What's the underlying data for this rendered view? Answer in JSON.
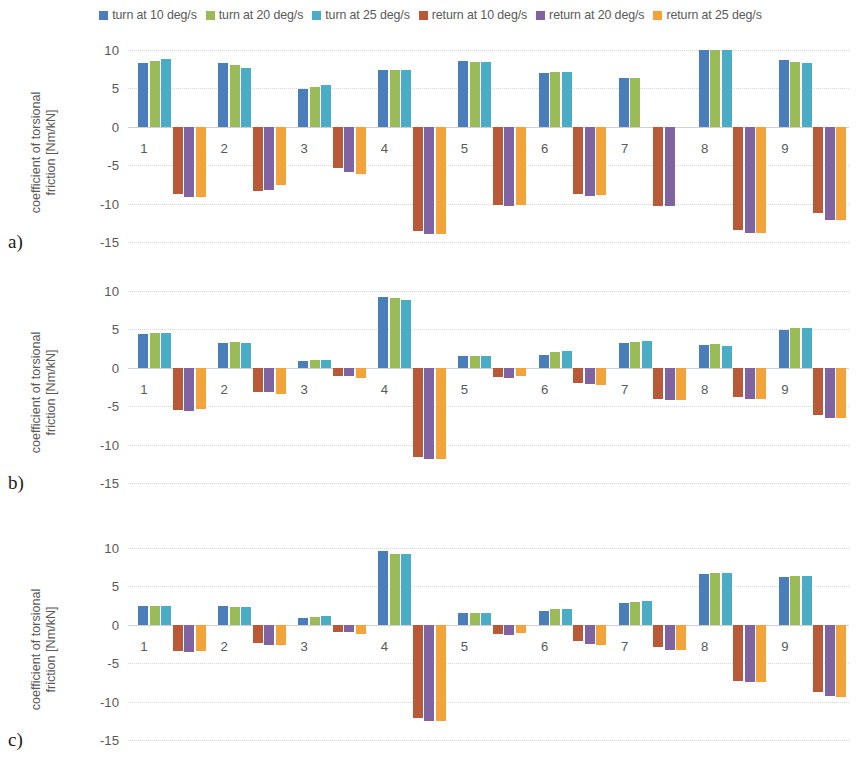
{
  "legend": {
    "entries": [
      {
        "label": "turn at 10 deg/s",
        "color": "#4A7EBB",
        "key": "turn10"
      },
      {
        "label": "turn at 20 deg/s",
        "color": "#9BBB59",
        "key": "turn20"
      },
      {
        "label": "turn at 25 deg/s",
        "color": "#4BACC6",
        "key": "turn25"
      },
      {
        "label": "return at 10 deg/s",
        "color": "#B85A37",
        "key": "ret10"
      },
      {
        "label": "return at 20 deg/s",
        "color": "#8064A2",
        "key": "ret20"
      },
      {
        "label": "return at 25 deg/s",
        "color": "#F2A33C",
        "key": "ret25"
      }
    ]
  },
  "panels": [
    {
      "id": "a",
      "letter": "a)"
    },
    {
      "id": "b",
      "letter": "b)"
    },
    {
      "id": "c",
      "letter": "c)"
    }
  ],
  "axis": {
    "ylabel_line1": "coefficient of torsional",
    "ylabel_line2": "friction [Nm/kN]",
    "yticks": [
      10,
      5,
      0,
      -5,
      -10,
      -15
    ],
    "ytick_labels": [
      "10",
      "5",
      "0",
      "-5",
      "-10",
      "-15"
    ],
    "ylim": [
      -15,
      10
    ],
    "categories": [
      "1",
      "2",
      "3",
      "4",
      "5",
      "6",
      "7",
      "8",
      "9"
    ]
  },
  "chart_data": [
    {
      "type": "bar",
      "panel": "a",
      "title": "",
      "xlabel": "",
      "ylabel": "coefficient of torsional friction [Nm/kN]",
      "ylim": [
        -15,
        10
      ],
      "yticks": [
        10,
        5,
        0,
        -5,
        -10,
        -15
      ],
      "grid": true,
      "legend_position": "top",
      "categories": [
        "1",
        "2",
        "3",
        "4",
        "5",
        "6",
        "7",
        "8",
        "9"
      ],
      "series": [
        {
          "name": "turn at 10 deg/s",
          "color": "#4A7EBB",
          "values": [
            8.3,
            8.3,
            4.9,
            7.4,
            8.6,
            7.0,
            6.4,
            10.0,
            8.7
          ]
        },
        {
          "name": "turn at 20 deg/s",
          "color": "#9BBB59",
          "values": [
            8.6,
            8.0,
            5.2,
            7.4,
            8.5,
            7.2,
            6.3,
            10.0,
            8.5
          ]
        },
        {
          "name": "turn at 25 deg/s",
          "color": "#4BACC6",
          "values": [
            8.8,
            7.7,
            5.5,
            7.4,
            8.5,
            7.2,
            null,
            10.0,
            8.3
          ]
        },
        {
          "name": "return at 10 deg/s",
          "color": "#B85A37",
          "values": [
            -8.8,
            -8.4,
            -5.4,
            -13.6,
            -10.2,
            -8.7,
            -10.3,
            -13.5,
            -11.2
          ]
        },
        {
          "name": "return at 20 deg/s",
          "color": "#8064A2",
          "values": [
            -9.1,
            -8.2,
            -5.9,
            -13.9,
            -10.3,
            -9.0,
            -10.3,
            -13.8,
            -12.2
          ]
        },
        {
          "name": "return at 25 deg/s",
          "color": "#F2A33C",
          "values": [
            -9.1,
            -7.6,
            -6.2,
            -13.9,
            -10.2,
            -8.9,
            null,
            -13.8,
            -12.2
          ]
        }
      ]
    },
    {
      "type": "bar",
      "panel": "b",
      "title": "",
      "xlabel": "",
      "ylabel": "coefficient of torsional friction [Nm/kN]",
      "ylim": [
        -15,
        10
      ],
      "yticks": [
        10,
        5,
        0,
        -5,
        -10,
        -15
      ],
      "grid": true,
      "legend_position": "top",
      "categories": [
        "1",
        "2",
        "3",
        "4",
        "5",
        "6",
        "7",
        "8",
        "9"
      ],
      "series": [
        {
          "name": "turn at 10 deg/s",
          "color": "#4A7EBB",
          "values": [
            4.4,
            3.2,
            0.9,
            9.2,
            1.5,
            1.7,
            3.2,
            3.0,
            4.9
          ]
        },
        {
          "name": "turn at 20 deg/s",
          "color": "#9BBB59",
          "values": [
            4.5,
            3.3,
            1.0,
            9.1,
            1.6,
            2.0,
            3.4,
            3.1,
            5.2
          ]
        },
        {
          "name": "turn at 25 deg/s",
          "color": "#4BACC6",
          "values": [
            4.5,
            3.2,
            1.0,
            8.8,
            1.6,
            2.2,
            3.5,
            2.8,
            5.2
          ]
        },
        {
          "name": "return at 10 deg/s",
          "color": "#B85A37",
          "values": [
            -5.5,
            -3.1,
            -1.1,
            -11.6,
            -1.2,
            -2.0,
            -4.0,
            -3.8,
            -6.2
          ]
        },
        {
          "name": "return at 20 deg/s",
          "color": "#8064A2",
          "values": [
            -5.6,
            -3.2,
            -1.1,
            -11.9,
            -1.3,
            -2.1,
            -4.2,
            -4.1,
            -6.5
          ]
        },
        {
          "name": "return at 25 deg/s",
          "color": "#F2A33C",
          "values": [
            -5.4,
            -3.4,
            -1.3,
            -11.9,
            -1.1,
            -2.3,
            -4.2,
            -4.1,
            -6.5
          ]
        }
      ]
    },
    {
      "type": "bar",
      "panel": "c",
      "title": "",
      "xlabel": "",
      "ylabel": "coefficient of torsional friction [Nm/kN]",
      "ylim": [
        -15,
        10
      ],
      "yticks": [
        10,
        5,
        0,
        -5,
        -10,
        -15
      ],
      "grid": true,
      "legend_position": "top",
      "categories": [
        "1",
        "2",
        "3",
        "4",
        "5",
        "6",
        "7",
        "8",
        "9"
      ],
      "series": [
        {
          "name": "turn at 10 deg/s",
          "color": "#4A7EBB",
          "values": [
            2.5,
            2.4,
            0.9,
            9.6,
            1.5,
            1.8,
            2.9,
            6.6,
            6.2
          ]
        },
        {
          "name": "turn at 20 deg/s",
          "color": "#9BBB59",
          "values": [
            2.5,
            2.3,
            1.0,
            9.2,
            1.5,
            2.0,
            3.0,
            6.8,
            6.3
          ]
        },
        {
          "name": "turn at 25 deg/s",
          "color": "#4BACC6",
          "values": [
            2.5,
            2.3,
            1.1,
            9.2,
            1.5,
            2.0,
            3.1,
            6.8,
            6.3
          ]
        },
        {
          "name": "return at 10 deg/s",
          "color": "#B85A37",
          "values": [
            -3.4,
            -2.4,
            -1.0,
            -12.1,
            -1.2,
            -2.1,
            -2.9,
            -7.3,
            -8.8
          ]
        },
        {
          "name": "return at 20 deg/s",
          "color": "#8064A2",
          "values": [
            -3.6,
            -2.6,
            -1.0,
            -12.5,
            -1.3,
            -2.5,
            -3.3,
            -7.5,
            -9.3
          ]
        },
        {
          "name": "return at 25 deg/s",
          "color": "#F2A33C",
          "values": [
            -3.4,
            -2.6,
            -1.2,
            -12.5,
            -1.1,
            -2.6,
            -3.3,
            -7.5,
            -9.4
          ]
        }
      ]
    }
  ]
}
